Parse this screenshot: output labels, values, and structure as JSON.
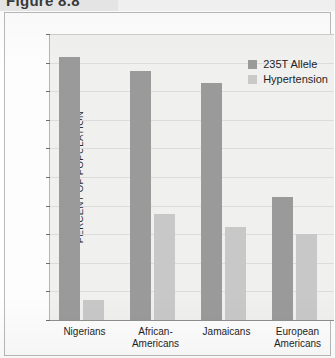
{
  "figure": {
    "title": "Figure 8.8"
  },
  "chart_data": {
    "type": "bar",
    "title": "Figure 8.8",
    "xlabel": "",
    "ylabel": "PERCENT OF POPULATION",
    "ylim": [
      0,
      100
    ],
    "ytick_step": 10,
    "yticks": [
      "100",
      "90",
      "80",
      "70",
      "60",
      "50",
      "40",
      "30",
      "20",
      "10",
      "0"
    ],
    "grid": true,
    "legend_position": "top-right-inside",
    "categories": [
      "Nigerians",
      "African-Americans",
      "Jamaicans",
      "European Americans"
    ],
    "category_lines": [
      [
        "Nigerians"
      ],
      [
        "African-",
        "Americans"
      ],
      [
        "Jamaicans"
      ],
      [
        "European",
        "Americans"
      ]
    ],
    "series": [
      {
        "name": "235T Allele",
        "color": "#9a9a9a",
        "values": [
          92,
          87,
          83,
          43
        ]
      },
      {
        "name": "Hypertension",
        "color": "#c8c8c8",
        "values": [
          7,
          37,
          32.5,
          30
        ]
      }
    ]
  },
  "legend": {
    "items": [
      {
        "label": "235T Allele"
      },
      {
        "label": "Hypertension"
      }
    ]
  },
  "colors": {
    "series_dark": "#9a9a9a",
    "series_light": "#c8c8c8",
    "plot_background": "#f0f0ef",
    "gridline": "#dcdcdc",
    "axis": "#8f8f8f",
    "text": "#1f1f1f"
  }
}
